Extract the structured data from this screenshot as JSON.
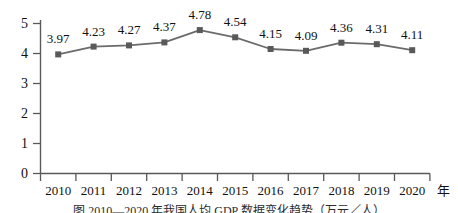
{
  "chart_data": {
    "type": "line",
    "title": "",
    "xlabel": "",
    "ylabel": "",
    "x_unit_label": "年",
    "categories": [
      "2010",
      "2011",
      "2012",
      "2013",
      "2014",
      "2015",
      "2016",
      "2017",
      "2018",
      "2019",
      "2020"
    ],
    "values": [
      3.97,
      4.23,
      4.27,
      4.37,
      4.78,
      4.54,
      4.15,
      4.09,
      4.36,
      4.31,
      4.11
    ],
    "point_labels": [
      "3.97",
      "4.23",
      "4.27",
      "4.37",
      "4.78",
      "4.54",
      "4.15",
      "4.09",
      "4.36",
      "4.31",
      "4.11"
    ],
    "ylim": [
      0,
      5
    ],
    "ytick_labels": [
      "0",
      "1",
      "2",
      "3",
      "4",
      "5"
    ],
    "ytick_values": [
      0,
      1,
      2,
      3,
      4,
      5
    ],
    "grid": false,
    "legend": null,
    "marker": "square",
    "series_color": "#6b6b6b",
    "marker_color": "#595959",
    "axis_color": "#595959"
  },
  "caption": {
    "text": "图  2010—2020 年我国人均 GDP 数据变化趋势（万元／人）"
  }
}
